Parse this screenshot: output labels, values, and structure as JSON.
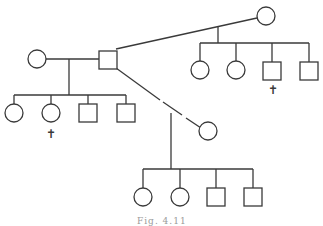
{
  "diagram": {
    "type": "pedigree",
    "caption": "Fig. 4.11",
    "legend_symbols": {
      "circle": "female",
      "square": "male",
      "cross": "deceased"
    },
    "cross_glyph": "✝",
    "individuals": [
      {
        "id": "I1",
        "sex": "female",
        "generation": 1,
        "position": "left spouse"
      },
      {
        "id": "I2",
        "sex": "male",
        "generation": 1,
        "position": "central male"
      },
      {
        "id": "I3",
        "sex": "female",
        "generation": 1,
        "position": "upper-right spouse"
      },
      {
        "id": "I4",
        "sex": "female",
        "generation": 1,
        "position": "lower-right spouse"
      },
      {
        "id": "II1",
        "sex": "female",
        "parents": [
          "I1",
          "I2"
        ],
        "deceased": false
      },
      {
        "id": "II2",
        "sex": "female",
        "parents": [
          "I1",
          "I2"
        ],
        "deceased": true
      },
      {
        "id": "II3",
        "sex": "male",
        "parents": [
          "I1",
          "I2"
        ],
        "deceased": false
      },
      {
        "id": "II4",
        "sex": "male",
        "parents": [
          "I1",
          "I2"
        ],
        "deceased": false
      },
      {
        "id": "II5",
        "sex": "female",
        "parents": [
          "I2",
          "I3"
        ],
        "deceased": false
      },
      {
        "id": "II6",
        "sex": "female",
        "parents": [
          "I2",
          "I3"
        ],
        "deceased": false
      },
      {
        "id": "II7",
        "sex": "male",
        "parents": [
          "I2",
          "I3"
        ],
        "deceased": true
      },
      {
        "id": "II8",
        "sex": "male",
        "parents": [
          "I2",
          "I3"
        ],
        "deceased": false
      },
      {
        "id": "II9",
        "sex": "female",
        "parents": [
          "I2",
          "I4"
        ],
        "deceased": false
      },
      {
        "id": "II10",
        "sex": "female",
        "parents": [
          "I2",
          "I4"
        ],
        "deceased": false
      },
      {
        "id": "II11",
        "sex": "male",
        "parents": [
          "I2",
          "I4"
        ],
        "deceased": false
      },
      {
        "id": "II12",
        "sex": "male",
        "parents": [
          "I2",
          "I4"
        ],
        "deceased": false
      }
    ],
    "matings": [
      {
        "partners": [
          "I1",
          "I2"
        ],
        "line": "solid"
      },
      {
        "partners": [
          "I2",
          "I3"
        ],
        "line": "solid"
      },
      {
        "partners": [
          "I2",
          "I4"
        ],
        "line": "broken"
      }
    ]
  }
}
